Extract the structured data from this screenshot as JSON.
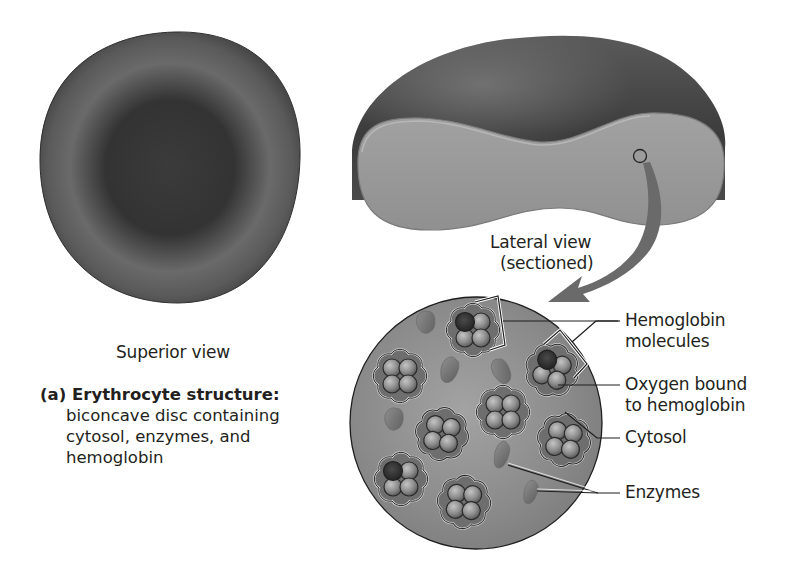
{
  "figure": {
    "superior_view": {
      "label": "Superior view"
    },
    "lateral_view": {
      "label_line1": "Lateral view",
      "label_line2": "(sectioned)"
    },
    "caption": {
      "prefix": "(a)",
      "title": "Erythrocyte structure:",
      "line1": "biconcave disc containing",
      "line2": "cytosol, enzymes, and",
      "line3": "hemoglobin"
    },
    "callouts": [
      {
        "line1": "Hemoglobin",
        "line2": "molecules"
      },
      {
        "line1": "Oxygen bound",
        "line2": "to hemoglobin"
      },
      {
        "line1": "Cytosol"
      },
      {
        "line1": "Enzymes"
      }
    ],
    "colors": {
      "cell_dark": "#3a3a3a",
      "cell_mid": "#6b6b6b",
      "section_face": "#9a9a9a",
      "cytosol": "#8c8c8c",
      "globule": "#9d9d9d",
      "label_text": "#231f20"
    }
  }
}
